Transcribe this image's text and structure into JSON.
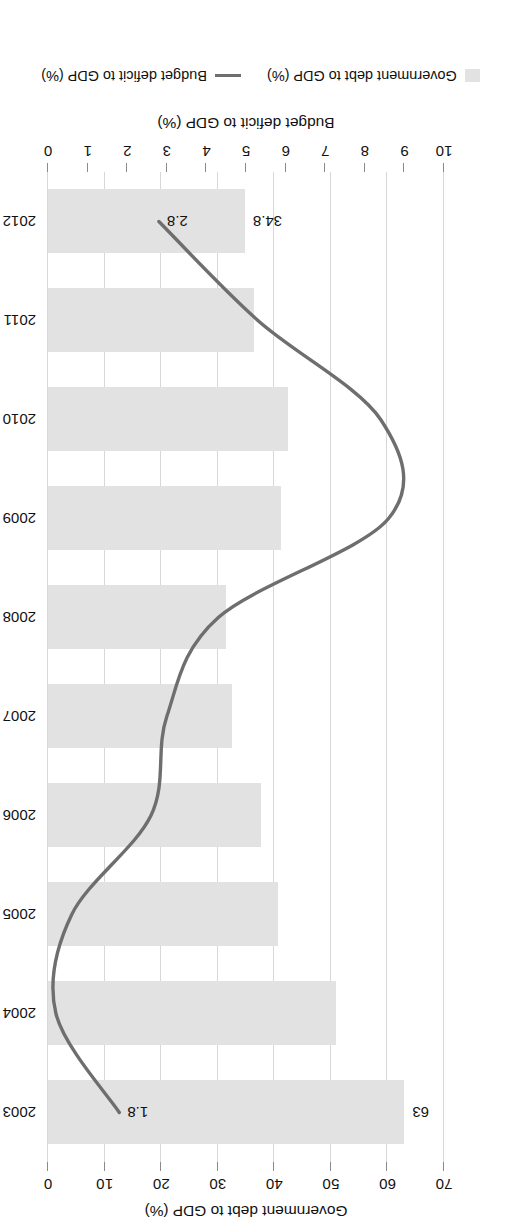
{
  "chart_data": {
    "type": "bar",
    "orientation": "vertical",
    "title": "",
    "categories": [
      "2003",
      "2004",
      "2005",
      "2006",
      "2007",
      "2008",
      "2009",
      "2010",
      "2011",
      "2012"
    ],
    "series": [
      {
        "name": "Government debt to GDP (%)",
        "axis": "left",
        "type": "bar",
        "color": "#e2e2e2",
        "values": [
          63,
          51,
          40.6,
          37.6,
          32.6,
          31.4,
          41.2,
          42.4,
          36.5,
          34.8
        ],
        "labeled_points": [
          {
            "category": "2003",
            "value": 63,
            "label": "63"
          },
          {
            "category": "2012",
            "value": 34.8,
            "label": "34.8"
          }
        ]
      },
      {
        "name": "Budget deficit to GDP (%)",
        "axis": "right",
        "type": "line",
        "color": "#6e6e6e",
        "values": [
          1.8,
          0.2,
          0.6,
          2.6,
          3.0,
          4.3,
          8.6,
          8.4,
          5.3,
          2.8
        ],
        "labeled_points": [
          {
            "category": "2003",
            "value": 1.8,
            "label": "1.8"
          },
          {
            "category": "2012",
            "value": 2.8,
            "label": "2.8"
          }
        ]
      }
    ],
    "left_axis": {
      "label": "Government debt to GDP (%)",
      "ticks": [
        0,
        10,
        20,
        30,
        40,
        50,
        60,
        70
      ],
      "tick_labels": [
        "0",
        "10",
        "20",
        "30",
        "40",
        "50",
        "60",
        "70"
      ],
      "min": 0,
      "max": 70
    },
    "right_axis": {
      "label": "Budget deficit to GDP (%)",
      "ticks": [
        0,
        1,
        2,
        3,
        4,
        5,
        6,
        7,
        8,
        9,
        10
      ],
      "tick_labels": [
        "0",
        "1",
        "2",
        "3",
        "4",
        "5",
        "6",
        "7",
        "8",
        "9",
        "10"
      ],
      "min": 0,
      "max": 10
    },
    "grid": true,
    "legend": {
      "position": "bottom",
      "entries": [
        {
          "label": "Government debt to GDP (%)",
          "marker": "bar",
          "color": "#e2e2e2"
        },
        {
          "label": "Budget deficit to GDP (%)",
          "marker": "line",
          "color": "#6e6e6e"
        }
      ]
    }
  },
  "colors": {
    "bar": "#e2e2e2",
    "line": "#6e6e6e",
    "grid": "#d7d7d7",
    "tick": "#8a8a8a",
    "text": "#111111",
    "background": "#ffffff"
  }
}
